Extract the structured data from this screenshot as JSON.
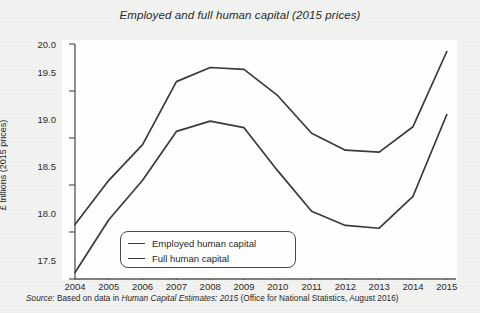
{
  "chart_data": {
    "type": "line",
    "title": "Employed and full human capital (2015 prices)",
    "xlabel": "",
    "ylabel": "£ trillions (2015 prices)",
    "categories": [
      "2004",
      "2005",
      "2006",
      "2007",
      "2008",
      "2009",
      "2010",
      "2011",
      "2012",
      "2013",
      "2014",
      "2015"
    ],
    "x": [
      2004,
      2005,
      2006,
      2007,
      2008,
      2009,
      2010,
      2011,
      2012,
      2013,
      2014,
      2015
    ],
    "xlim": [
      2004,
      2015
    ],
    "ylim": [
      17.5,
      20.0
    ],
    "yticks": [
      "17.5",
      "18.0",
      "18.5",
      "19.0",
      "19.5",
      "20.0"
    ],
    "ytick_values": [
      17.5,
      18.0,
      18.5,
      19.0,
      19.5,
      20.0
    ],
    "grid": false,
    "legend_position": "lower-center-left",
    "series": [
      {
        "name": "Employed human capital",
        "values": [
          17.57,
          18.13,
          18.55,
          19.07,
          19.18,
          19.11,
          18.65,
          18.22,
          18.07,
          18.04,
          18.38,
          19.25
        ],
        "color": "#3a3a3a"
      },
      {
        "name": "Full human capital",
        "values": [
          18.08,
          18.55,
          18.93,
          19.6,
          19.75,
          19.73,
          19.45,
          19.05,
          18.87,
          18.85,
          19.12,
          19.92
        ],
        "color": "#3a3a3a"
      }
    ]
  },
  "source": {
    "lead": "Source:",
    "text_before": " Based on data in ",
    "italic_part": "Human Capital Estimates: 2015",
    "text_after": " (Office for National Statistics, August 2016)"
  },
  "colors": {
    "background": "#f2f2f1",
    "plot_background": "#ffffff",
    "axis": "#555555",
    "line": "#3a3a3a",
    "text": "#2a2a2a"
  }
}
